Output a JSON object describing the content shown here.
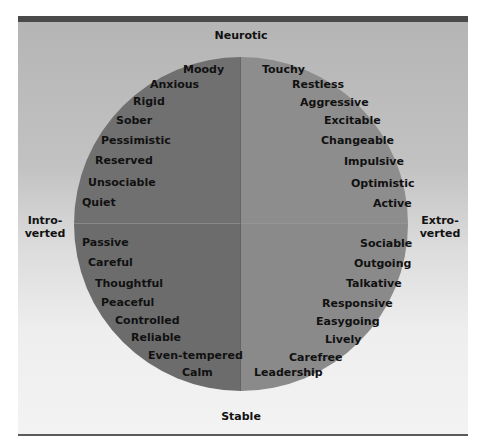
{
  "axes": {
    "top": "Neurotic",
    "bottom": "Stable",
    "left_line1": "Intro-",
    "left_line2": "verted",
    "right_line1": "Extro-",
    "right_line2": "verted"
  },
  "colors": {
    "top_bar": "#4a4a4a",
    "left_half": "#707070",
    "right_half": "#8d8d8d",
    "text": "#111111"
  },
  "quadrants": {
    "neurotic_introverted": [
      "Moody",
      "Anxious",
      "Rigid",
      "Sober",
      "Pessimistic",
      "Reserved",
      "Unsociable",
      "Quiet"
    ],
    "neurotic_extroverted": [
      "Touchy",
      "Restless",
      "Aggressive",
      "Excitable",
      "Changeable",
      "Impulsive",
      "Optimistic",
      "Active"
    ],
    "stable_introverted": [
      "Passive",
      "Careful",
      "Thoughtful",
      "Peaceful",
      "Controlled",
      "Reliable",
      "Even-tempered",
      "Calm"
    ],
    "stable_extroverted": [
      "Sociable",
      "Outgoing",
      "Talkative",
      "Responsive",
      "Easygoing",
      "Lively",
      "Carefree",
      "Leadership"
    ]
  }
}
